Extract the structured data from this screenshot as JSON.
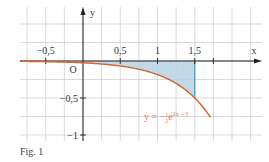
{
  "caption": "Fig. 1",
  "colors": {
    "grid": "#c9c9c9",
    "axis": "#222222",
    "curve": "#d9622b",
    "shade": "#b7d3e3",
    "bound_line": "#3aa0dc",
    "text": "#333333",
    "formula": "#e07b3c"
  },
  "chart_data": {
    "type": "line",
    "title": "",
    "caption": "Fig. 1",
    "xlabel": "x",
    "ylabel": "y",
    "origin_label": "O",
    "xlim": [
      -0.75,
      1.75
    ],
    "ylim": [
      -1.05,
      0.45
    ],
    "grid": true,
    "grid_step": 0.25,
    "x_ticks": [
      {
        "value": -0.5,
        "label": "−0,5"
      },
      {
        "value": 0.5,
        "label": "0,5"
      },
      {
        "value": 1,
        "label": "1"
      },
      {
        "value": 1.5,
        "label": "1,5"
      }
    ],
    "y_ticks": [
      {
        "value": -0.5,
        "label": "−0,5"
      },
      {
        "value": -1,
        "label": "−1"
      }
    ],
    "series": [
      {
        "name": "y = −½e^(2x−3)",
        "formula_label": "y = −",
        "formula_frac": "1",
        "formula_frac_den": "2",
        "formula_exp_base": "e",
        "formula_exp": "2x − 3",
        "function": "-0.5*exp(2x-3)",
        "x": [
          -0.75,
          -0.5,
          -0.25,
          0,
          0.25,
          0.5,
          0.75,
          1,
          1.25,
          1.5,
          1.6,
          1.7
        ],
        "y": [
          -0.006,
          -0.009,
          -0.015,
          -0.025,
          -0.041,
          -0.068,
          -0.112,
          -0.184,
          -0.303,
          -0.5,
          -0.611,
          -0.746
        ]
      }
    ],
    "shaded_region": {
      "description": "Area between curve and x-axis from x=0 to x=1.5",
      "x_from": 0,
      "x_to": 1.5
    },
    "vertical_line": {
      "x": 1.5,
      "y_from": 0,
      "y_to": -0.5
    }
  }
}
